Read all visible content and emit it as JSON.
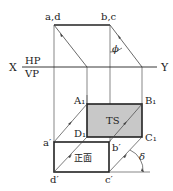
{
  "diagram": {
    "type": "orthographic projection with auxiliary view",
    "labels": {
      "top_left": "a,d",
      "top_right": "b,c",
      "x_axis": "X",
      "y_axis": "Y",
      "hp": "HP",
      "vp": "VP",
      "phi": "ϕ",
      "delta": "δ",
      "A1": "A₁",
      "B1": "B₁",
      "C1": "C₁",
      "D1": "D₁",
      "a_prime": "a′",
      "b_prime": "b′",
      "c_prime": "c′",
      "d_prime": "d′",
      "ts": "TS",
      "front": "正面"
    },
    "colors": {
      "line": "#222222",
      "ts_fill": "#c8c8c8",
      "thin": "#555555"
    }
  }
}
